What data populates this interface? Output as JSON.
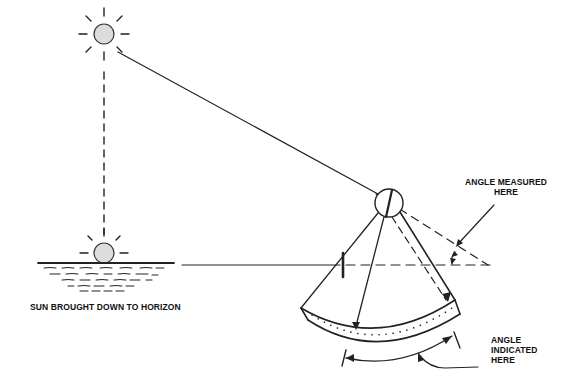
{
  "diagram": {
    "labels": {
      "sun_horizon": "SUN BROUGHT DOWN TO HORIZON",
      "angle_measured_line1": "ANGLE MEASURED",
      "angle_measured_line2": "HERE",
      "angle_indicated_line1": "ANGLE",
      "angle_indicated_line2": "INDICATED",
      "angle_indicated_line3": "HERE"
    },
    "elements": {
      "sun_in_sky": "sun-icon",
      "sun_on_horizon": "sun-icon",
      "water": "water-waves",
      "sextant": "sextant-frame",
      "index_mirror": "mirror-circle",
      "horizon_glass": "horizon-glass-tick",
      "arc_scale": "graduated-arc"
    },
    "colors": {
      "line": "#222222",
      "sun_fill": "#dcdcdc",
      "background": "#ffffff"
    }
  }
}
